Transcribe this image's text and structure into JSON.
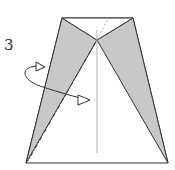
{
  "diagram": {
    "type": "origami-step",
    "step_number": "3",
    "colors": {
      "paper_front": "#ffffff",
      "paper_back": "#c8c8c8",
      "outline": "#333333",
      "crease": "#b0b0b0",
      "arrow": "#333333"
    },
    "points": {
      "top_left": [
        62,
        18
      ],
      "top_right": [
        133,
        18
      ],
      "center": [
        97,
        40
      ],
      "bottom_left": [
        26,
        163
      ],
      "bottom_right": [
        168,
        163
      ]
    },
    "annotations": [
      "turn-over arrow",
      "valley fold (dash-dot) along left inner edge",
      "vertical center crease"
    ]
  }
}
